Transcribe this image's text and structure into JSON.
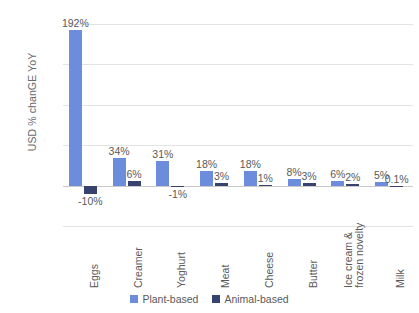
{
  "chart_data": {
    "type": "bar",
    "title": "",
    "xlabel": "",
    "ylabel": "USD % chanGE YoY",
    "ylim": [
      -50,
      200
    ],
    "yticks": [
      "200%",
      "150%",
      "100%",
      "50%",
      "0%",
      "-50%"
    ],
    "ytick_values": [
      200,
      150,
      100,
      50,
      0,
      -50
    ],
    "grid": true,
    "legend_position": "bottom",
    "categories": [
      "Eggs",
      "Creamer",
      "Yoghurt",
      "Meat",
      "Cheese",
      "Butter",
      "Ice cream &\nfrozen novelty",
      "Milk"
    ],
    "series": [
      {
        "name": "Plant-based",
        "color": "#6c8ddb",
        "values": [
          192,
          34,
          31,
          18,
          18,
          8,
          6,
          5
        ],
        "labels": [
          "192%",
          "34%",
          "31%",
          "18%",
          "18%",
          "8%",
          "6%",
          "5%"
        ]
      },
      {
        "name": "Animal-based",
        "color": "#37426f",
        "values": [
          -10,
          6,
          -1,
          3,
          1,
          3,
          2,
          0.1
        ],
        "labels": [
          "-10%",
          "6%",
          "-1%",
          "3%",
          "1%",
          "3%",
          "2%",
          "0.1%"
        ]
      }
    ]
  },
  "legend": {
    "items": [
      {
        "label": "Plant-based"
      },
      {
        "label": "Animal-based"
      }
    ]
  }
}
